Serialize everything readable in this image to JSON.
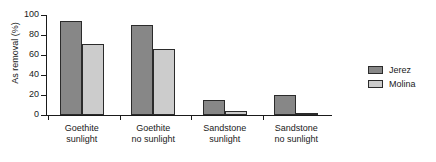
{
  "chart_data": {
    "type": "bar",
    "title": "",
    "xlabel": "",
    "ylabel": "As removal (%)",
    "ylim": [
      0,
      100
    ],
    "yticks": [
      0,
      20,
      40,
      60,
      80,
      100
    ],
    "ytick_labels": [
      "0",
      "20",
      "40",
      "60",
      "80",
      "100"
    ],
    "grid": false,
    "legend_position": "right",
    "categories": [
      "Goethite sunlight",
      "Goethite no sunlight",
      "Sandstone sunlight",
      "Sandstone no sunlight"
    ],
    "category_lines": [
      [
        "Goethite",
        "sunlight"
      ],
      [
        "Goethite",
        "no sunlight"
      ],
      [
        "Sandstone",
        "sunlight"
      ],
      [
        "Sandstone",
        "no sunlight"
      ]
    ],
    "series": [
      {
        "name": "Jerez",
        "color": "#878787",
        "values": [
          94,
          90,
          15,
          20
        ]
      },
      {
        "name": "Molina",
        "color": "#cccccc",
        "values": [
          71,
          66,
          4,
          1
        ]
      }
    ]
  },
  "legend": {
    "items": [
      {
        "label": "Jerez",
        "color": "#878787"
      },
      {
        "label": "Molina",
        "color": "#cccccc"
      }
    ]
  },
  "colors": {
    "axis": "#1a1a1a",
    "bar_edge": "#2b2b2b",
    "background": "#ffffff",
    "jerez": "#878787",
    "molina": "#cccccc"
  }
}
